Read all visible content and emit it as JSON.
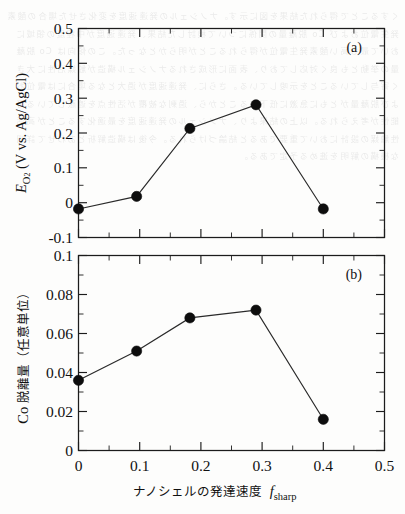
{
  "figure": {
    "panel_a_label": "(a)",
    "panel_b_label": "(b)",
    "xaxis_label_jp": "ナノシェルの発達速度",
    "xaxis_label_sym": "f",
    "xaxis_label_sym_sub": "sharp",
    "yaxis_a_sym": "E",
    "yaxis_a_sym_sub": "O",
    "yaxis_a_sym_sub2": "2",
    "yaxis_a_rest": "(V vs. Ag/AgCl)",
    "yaxis_b_prefix": "Co",
    "yaxis_b_jp": "脱離量（任意単位）",
    "x_ticks": [
      "0",
      "0.1",
      "0.2",
      "0.3",
      "0.4",
      "0.5"
    ],
    "y_ticks_a": [
      "-0.1",
      "0",
      "0.1",
      "0.2",
      "0.3",
      "0.4",
      "0.5"
    ],
    "y_ticks_b": [
      "0",
      "0.02",
      "0.04",
      "0.06",
      "0.08",
      "0.1"
    ],
    "line_color": "#2a2a2a",
    "marker_color": "#0d0d0d"
  },
  "bleed_text": "くすることで得られた結果を図に示す。ナノシェルの発達速度を変化させた場合の酸素発生電位および Co 脱離量の関係について検討した結果、発達速度が中程度の領域において最も高い酸素発生電位が得られることが明らかとなった。この傾向は Co 脱離量の挙動とも良く対応しており、表面に形成されるナノシェル構造が触媒活性に大きく寄与していることを示唆している。さらに、発達速度が過大となる場合には電位および脱離量がともに急激に低下することから、過剰な被覆が活性点を遮蔽している可能性が考えられる。以上の結果より、ナノシェルの発達速度を最適化することが高活性触媒の設計において重要であると結論づけられる。今後は構造解析とあわせて詳細な機構の解明を進める予定である。",
  "chart_data": [
    {
      "type": "line",
      "panel": "a",
      "title": "(a)",
      "xlabel": "ナノシェルの発達速度 f_sharp",
      "ylabel": "E_O2 (V vs. Ag/AgCl)",
      "xlim": [
        0,
        0.5
      ],
      "ylim": [
        -0.1,
        0.5
      ],
      "xticks": [
        0,
        0.1,
        0.2,
        0.3,
        0.4,
        0.5
      ],
      "yticks": [
        -0.1,
        0,
        0.1,
        0.2,
        0.3,
        0.4,
        0.5
      ],
      "grid": false,
      "legend": "none",
      "x": [
        0,
        0.095,
        0.182,
        0.29,
        0.4
      ],
      "values": [
        -0.018,
        0.018,
        0.213,
        0.281,
        -0.018
      ],
      "markers": "filled-circle"
    },
    {
      "type": "line",
      "panel": "b",
      "title": "(b)",
      "xlabel": "ナノシェルの発達速度 f_sharp",
      "ylabel": "Co 脱離量（任意単位）",
      "xlim": [
        0,
        0.5
      ],
      "ylim": [
        0,
        0.1
      ],
      "xticks": [
        0,
        0.1,
        0.2,
        0.3,
        0.4,
        0.5
      ],
      "yticks": [
        0,
        0.02,
        0.04,
        0.06,
        0.08,
        0.1
      ],
      "grid": false,
      "legend": "none",
      "x": [
        0,
        0.095,
        0.182,
        0.29,
        0.4
      ],
      "values": [
        0.036,
        0.051,
        0.068,
        0.072,
        0.016
      ],
      "markers": "filled-circle"
    }
  ]
}
